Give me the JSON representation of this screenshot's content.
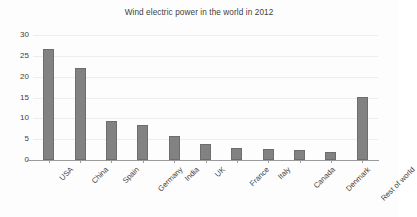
{
  "chart_data": {
    "type": "bar",
    "title": "Wind electric power in the world in 2012",
    "xlabel": "",
    "ylabel": "",
    "categories": [
      "USA",
      "China",
      "Spain",
      "Germany",
      "India",
      "UK",
      "France",
      "Italy",
      "Canada",
      "Denmark",
      "Rest of world"
    ],
    "values": [
      26.6,
      22.1,
      9.4,
      8.5,
      5.7,
      3.9,
      3.0,
      2.7,
      2.3,
      2.0,
      15.2
    ],
    "ylim": [
      0,
      30
    ],
    "yticks": [
      0,
      5,
      10,
      15,
      20,
      25,
      30
    ],
    "ytick_labels": [
      "0",
      "5",
      "10",
      "15",
      "20",
      "25",
      "30"
    ],
    "grid": true,
    "grid_axis": "y",
    "legend": false,
    "legend_position": "none",
    "bar_color": "#828282",
    "bar_edge_color": "#6d6d6d",
    "gridline_color": "#ededed",
    "axis_color": "#9a9a9a",
    "text_color": "#3d3d3d",
    "background_color": "#fdfdfd",
    "xtick_label_rotation": -45
  }
}
